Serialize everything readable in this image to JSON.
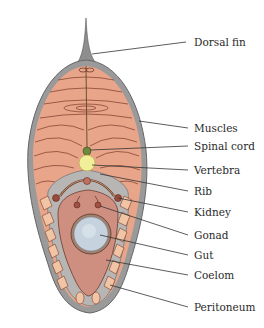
{
  "diagram": {
    "type": "labeled cross-section",
    "colors": {
      "muscle": "#e9a58a",
      "muscle_lines": "#7a3a28",
      "skin": "#8a8a8a",
      "peritoneum_gray": "#b8b6b4",
      "coelom": "#cf8f80",
      "vertebra": "#f2ef9a",
      "gut": "#c6d3de",
      "kidney": "#9b4a3a",
      "leader_line": "#333333"
    },
    "labels": [
      {
        "id": "dorsal-fin",
        "text": "Dorsal fin",
        "x": 194,
        "y": 36
      },
      {
        "id": "muscles",
        "text": "Muscles",
        "x": 194,
        "y": 122
      },
      {
        "id": "spinal-cord",
        "text": "Spinal cord",
        "x": 194,
        "y": 140
      },
      {
        "id": "vertebra",
        "text": "Vertebra",
        "x": 194,
        "y": 164
      },
      {
        "id": "rib",
        "text": "Rib",
        "x": 194,
        "y": 185
      },
      {
        "id": "kidney",
        "text": "Kidney",
        "x": 194,
        "y": 206
      },
      {
        "id": "gonad",
        "text": "Gonad",
        "x": 194,
        "y": 229
      },
      {
        "id": "gut",
        "text": "Gut",
        "x": 194,
        "y": 249
      },
      {
        "id": "coelom",
        "text": "Coelom",
        "x": 194,
        "y": 269
      },
      {
        "id": "peritoneum",
        "text": "Peritoneum",
        "x": 194,
        "y": 301
      }
    ]
  }
}
